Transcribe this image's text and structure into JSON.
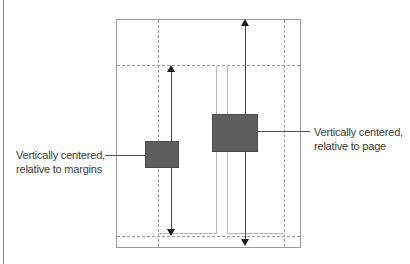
{
  "diagram": {
    "title": "",
    "labels": {
      "margins": {
        "line1": "Vertically centered,",
        "line2": "relative to margins"
      },
      "page": {
        "line1": "Vertically centered,",
        "line2": "relative to page"
      }
    },
    "elements": {
      "page_outline": "page",
      "margin_guides": "dashed margins",
      "box_margins": "object centered relative to margins",
      "box_page": "object centered relative to page"
    },
    "colors": {
      "box_fill": "#5e5e5e",
      "guide": "#9a9a9a",
      "arrow": "#1a1a1a",
      "text": "#3a3a3a"
    }
  }
}
